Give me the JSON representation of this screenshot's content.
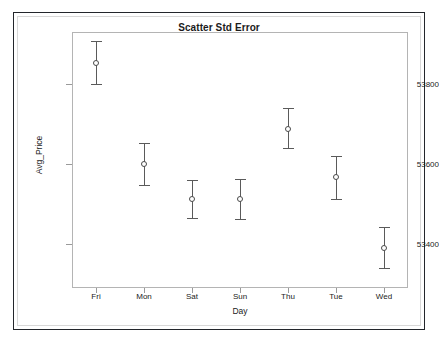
{
  "page": {
    "top_strip_ghost_text": "",
    "background_color": "#ffffff",
    "border_color": "#23262b"
  },
  "chart_data": {
    "type": "scatter",
    "title": "Scatter Std Error",
    "xlabel": "Day",
    "ylabel": "Avg_Price",
    "categories": [
      "Fri",
      "Mon",
      "Sat",
      "Sun",
      "Thu",
      "Tue",
      "Wed"
    ],
    "values": [
      53852,
      53600,
      53513,
      53513,
      53687,
      53567,
      53390
    ],
    "error_low": [
      53800,
      53547,
      53465,
      53462,
      53640,
      53512,
      53340
    ],
    "error_high": [
      53908,
      53653,
      53560,
      53563,
      53740,
      53620,
      53443
    ],
    "ylim": [
      53290,
      53930
    ],
    "yticks": [
      53400,
      53600,
      53800
    ],
    "ytick_labels": [
      "53400",
      "53600",
      "53800"
    ],
    "grid": false,
    "legend": "none",
    "marker": "open-circle",
    "marker_color": "#4a4a4a",
    "errorbar_color": "#5a5a5a",
    "axis_color": "#b4b4b4"
  }
}
